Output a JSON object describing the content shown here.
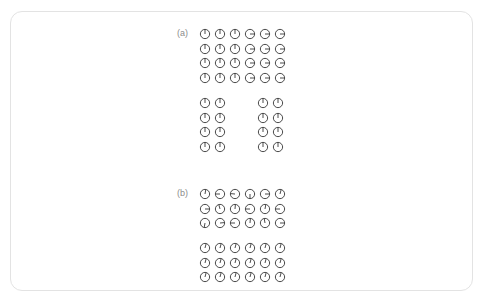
{
  "page": {
    "background_color": "#ffffff",
    "card_border_color": "#e3e3e3"
  },
  "figure": {
    "labels": {
      "a": "(a)",
      "b": "(b)"
    },
    "label_color": "#8c8c8c",
    "stroke_color": "#404040",
    "angle_unit": "degrees_ccw_from_east",
    "grids": {
      "a_top": {
        "rows": 4,
        "cols": 6,
        "description": "two aligned domains: left three columns up, right three columns right",
        "angles": [
          [
            90,
            90,
            90,
            0,
            0,
            0
          ],
          [
            90,
            90,
            90,
            0,
            0,
            0
          ],
          [
            90,
            90,
            90,
            0,
            0,
            0
          ],
          [
            90,
            90,
            90,
            0,
            0,
            0
          ]
        ]
      },
      "a_bottom_left": {
        "rows": 4,
        "cols": 2,
        "description": "all spins up",
        "angles": [
          [
            90,
            90
          ],
          [
            90,
            90
          ],
          [
            90,
            90
          ],
          [
            90,
            90
          ]
        ]
      },
      "a_bottom_right": {
        "rows": 4,
        "cols": 2,
        "description": "all spins up",
        "angles": [
          [
            90,
            90
          ],
          [
            90,
            90
          ],
          [
            90,
            90
          ],
          [
            90,
            90
          ]
        ]
      },
      "b_top": {
        "rows": 3,
        "cols": 6,
        "description": "randomly oriented spins",
        "angles": [
          [
            80,
            180,
            175,
            270,
            0,
            75
          ],
          [
            0,
            105,
            85,
            180,
            80,
            180
          ],
          [
            260,
            5,
            180,
            85,
            100,
            0
          ]
        ]
      },
      "b_bottom": {
        "rows": 3,
        "cols": 6,
        "description": "aligned spins, slight clockwise tilt",
        "angles": [
          [
            75,
            75,
            75,
            75,
            75,
            75
          ],
          [
            75,
            75,
            75,
            75,
            75,
            75
          ],
          [
            75,
            75,
            75,
            75,
            75,
            75
          ]
        ]
      }
    }
  }
}
